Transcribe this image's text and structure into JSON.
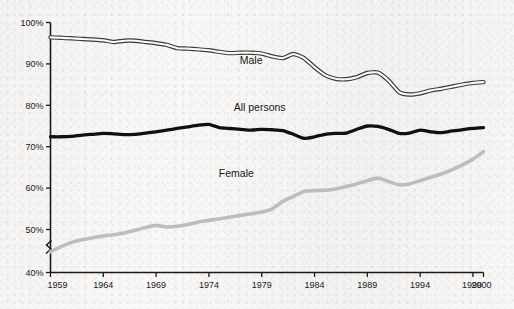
{
  "chart_data": {
    "type": "line",
    "title": "",
    "subtitle": "",
    "xlabel": "",
    "ylabel": "",
    "xlim": [
      1959,
      2000
    ],
    "ylim": [
      40,
      100
    ],
    "y_axis_break": {
      "between": [
        40,
        50
      ],
      "symbol": "zigzag"
    },
    "grid": false,
    "legend_position": "inline-annotations",
    "y_ticks": [
      "40%",
      "50%",
      "60%",
      "70%",
      "80%",
      "90%",
      "100%"
    ],
    "y_tick_values": [
      40,
      50,
      60,
      70,
      80,
      90,
      100
    ],
    "x_ticks": [
      "1959",
      "1964",
      "1969",
      "1974",
      "1979",
      "1984",
      "1989",
      "1994",
      "1999",
      "2000"
    ],
    "x_tick_values": [
      1959,
      1964,
      1969,
      1974,
      1979,
      1984,
      1989,
      1994,
      1999,
      2000
    ],
    "x": [
      1959,
      1960,
      1961,
      1962,
      1963,
      1964,
      1965,
      1966,
      1967,
      1968,
      1969,
      1970,
      1971,
      1972,
      1973,
      1974,
      1975,
      1976,
      1977,
      1978,
      1979,
      1980,
      1981,
      1982,
      1983,
      1984,
      1985,
      1986,
      1987,
      1988,
      1989,
      1990,
      1991,
      1992,
      1993,
      1994,
      1995,
      1996,
      1997,
      1998,
      1999,
      2000
    ],
    "series": [
      {
        "name": "Male",
        "color": "#3c3c3c",
        "style": "double-stroke",
        "values": [
          96.4,
          96.3,
          96.2,
          96.0,
          95.9,
          95.7,
          95.3,
          95.6,
          95.6,
          95.3,
          95.0,
          94.6,
          93.8,
          93.7,
          93.5,
          93.3,
          92.9,
          92.6,
          92.7,
          92.7,
          92.5,
          91.8,
          91.4,
          92.4,
          91.4,
          89.2,
          87.3,
          86.4,
          86.3,
          86.8,
          87.8,
          87.9,
          86.0,
          83.2,
          82.6,
          82.9,
          83.6,
          84.0,
          84.5,
          85.0,
          85.4,
          85.6
        ]
      },
      {
        "name": "All persons",
        "color": "#111111",
        "style": "thick-solid",
        "values": [
          72.4,
          72.4,
          72.5,
          72.8,
          73.0,
          73.2,
          73.1,
          72.9,
          73.0,
          73.3,
          73.6,
          74.0,
          74.4,
          74.8,
          75.2,
          75.4,
          74.6,
          74.4,
          74.2,
          74.0,
          74.2,
          74.1,
          73.9,
          73.0,
          72.0,
          72.4,
          73.0,
          73.2,
          73.3,
          74.2,
          75.0,
          74.9,
          74.2,
          73.2,
          73.3,
          74.0,
          73.6,
          73.4,
          73.8,
          74.1,
          74.4,
          74.6
        ]
      },
      {
        "name": "Female",
        "color": "#bdbdbd",
        "style": "thick-solid",
        "values": [
          44.8,
          46.0,
          47.0,
          47.6,
          48.1,
          48.5,
          48.8,
          49.2,
          49.8,
          50.5,
          51.0,
          50.6,
          50.8,
          51.2,
          51.8,
          52.2,
          52.6,
          53.0,
          53.4,
          53.8,
          54.2,
          55.0,
          56.8,
          58.0,
          59.2,
          59.4,
          59.5,
          59.8,
          60.4,
          61.0,
          61.8,
          62.4,
          61.6,
          60.8,
          61.0,
          61.8,
          62.6,
          63.4,
          64.4,
          65.6,
          67.0,
          68.8
        ]
      }
    ]
  },
  "annotations": [
    {
      "name": "male-label",
      "text": "Male",
      "x": 1978.0,
      "y": 90.0
    },
    {
      "name": "all-persons-label",
      "text": "All persons",
      "x": 1978.8,
      "y": 78.6
    },
    {
      "name": "female-label",
      "text": "Female",
      "x": 1976.6,
      "y": 62.8
    }
  ],
  "axes": {
    "y_tick_labels": [
      "100%",
      "90%",
      "80%",
      "70%",
      "60%",
      "50%",
      "40%"
    ],
    "x_tick_labels": [
      "1959",
      "1964",
      "1969",
      "1974",
      "1979",
      "1984",
      "1989",
      "1994",
      "1999",
      "2000"
    ]
  }
}
